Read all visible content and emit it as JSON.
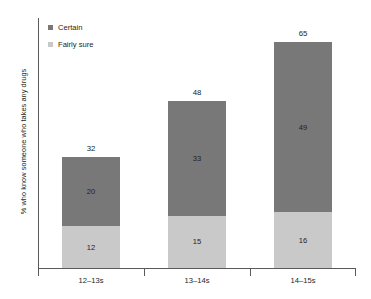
{
  "chart_data": {
    "type": "bar",
    "subtype": "stacked-bar",
    "title": "",
    "xlabel": "",
    "ylabel": "% who know someone who takes any drugs",
    "categories": [
      "12–13s",
      "13–14s",
      "14–15s"
    ],
    "series": [
      {
        "name": "Fairly sure",
        "color": "#c9c9c9",
        "values": [
          12,
          15,
          16
        ]
      },
      {
        "name": "Certain",
        "color": "#787878",
        "values": [
          20,
          33,
          49
        ]
      }
    ],
    "totals": [
      32,
      48,
      65
    ],
    "ylim": [
      0,
      72
    ],
    "grid": false,
    "legend_position": "top-left-inside",
    "stack_order_bottom_to_top": [
      "Fairly sure",
      "Certain"
    ]
  },
  "legend": {
    "items": [
      {
        "label": "Certain",
        "color": "#787878"
      },
      {
        "label": "Fairly sure",
        "color": "#c9c9c9"
      }
    ]
  },
  "axes": {
    "y_title": "% who know someone who takes any drugs",
    "x_labels": [
      "12–13s",
      "13–14s",
      "14–15s"
    ]
  },
  "bars": [
    {
      "category": "12–13s",
      "total": 32,
      "certain": 20,
      "fairly_sure": 12
    },
    {
      "category": "13–14s",
      "total": 48,
      "certain": 33,
      "fairly_sure": 15
    },
    {
      "category": "14–15s",
      "total": 65,
      "certain": 49,
      "fairly_sure": 16
    }
  ]
}
